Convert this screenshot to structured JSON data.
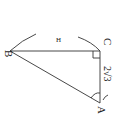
{
  "diagram": {
    "type": "geometry-right-triangle",
    "points": {
      "A": {
        "label": "A",
        "x": 100,
        "y": 103
      },
      "B": {
        "label": "B",
        "x": 10,
        "y": 51
      },
      "C": {
        "label": "C",
        "x": 100,
        "y": 51
      }
    },
    "side_labels": {
      "AC": "2√3",
      "arc_mark": "H"
    },
    "right_angle_at": "C",
    "angle_marked_at": "A",
    "colors": {
      "stroke": "#333333",
      "background": "#ffffff"
    }
  }
}
